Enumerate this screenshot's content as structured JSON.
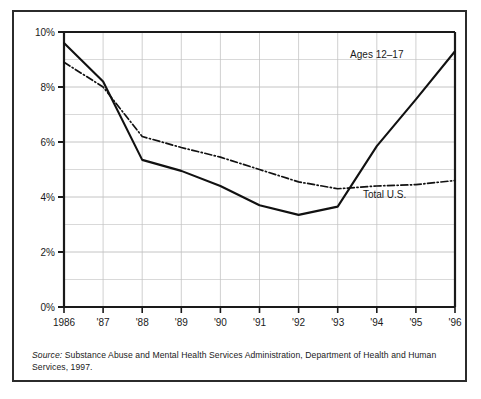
{
  "figure": {
    "source_label": "Source:",
    "source_text": " Substance Abuse and Mental Health Services Administration, Department of Health and Human Services, 1997."
  },
  "chart_data": {
    "type": "line",
    "title": "",
    "subtitle": "",
    "xlabel": "",
    "ylabel": "",
    "x": [
      1986,
      1987,
      1988,
      1989,
      1990,
      1991,
      1992,
      1993,
      1994,
      1995,
      1996
    ],
    "categories": [
      "1986",
      "'87",
      "'88",
      "'89",
      "'90",
      "'91",
      "'92",
      "'93",
      "'94",
      "'95",
      "'96"
    ],
    "xtick_labels": [
      "1986",
      "'87",
      "'88",
      "'89",
      "'90",
      "'91",
      "'92",
      "'93",
      "'94",
      "'95",
      "'96"
    ],
    "ytick_labels": [
      "0%",
      "2%",
      "4%",
      "6%",
      "8%",
      "10%"
    ],
    "ytick_values": [
      0,
      2,
      4,
      6,
      8,
      10
    ],
    "yminor_values": [
      1,
      3,
      5,
      7,
      9
    ],
    "ylim": [
      0,
      10
    ],
    "xlim": [
      1986,
      1996
    ],
    "grid": "horizontal-major-and-minor plus vertical at each year",
    "legend": "inline-labels",
    "series": [
      {
        "name": "Ages 12–17",
        "label": "Ages 12–17",
        "style": "solid",
        "color": "#111111",
        "values": [
          9.6,
          8.2,
          5.35,
          4.95,
          4.4,
          3.7,
          3.35,
          3.65,
          5.85,
          7.55,
          9.3
        ]
      },
      {
        "name": "Total U.S.",
        "label": "Total U.S.",
        "style": "dash-dot",
        "color": "#111111",
        "values": [
          8.9,
          8.0,
          6.2,
          5.8,
          5.45,
          5.0,
          4.55,
          4.3,
          4.4,
          4.45,
          4.6
        ]
      }
    ],
    "annotations": [
      {
        "text": "Ages 12–17",
        "x": 1994.0,
        "y": 9.05
      },
      {
        "text": "Total U.S.",
        "x": 1994.2,
        "y": 3.95
      }
    ]
  }
}
